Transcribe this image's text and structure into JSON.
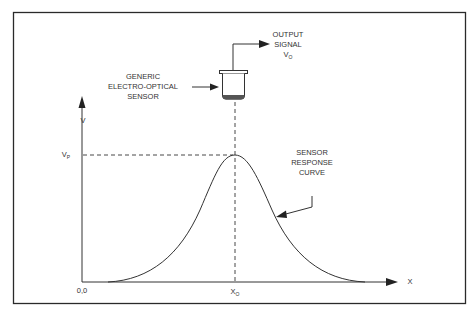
{
  "diagram": {
    "labels": {
      "output_signal": [
        "OUTPUT",
        "SIGNAL"
      ],
      "output_symbol": "V",
      "output_subscript": "O",
      "sensor": [
        "GENERIC",
        "ELECTRO-OPTICAL",
        "SENSOR"
      ],
      "y_axis": "V",
      "peak_symbol": "V",
      "peak_subscript": "P",
      "curve": [
        "SENSOR",
        "RESPONSE",
        "CURVE"
      ],
      "origin": "0,0",
      "x0_symbol": "X",
      "x0_subscript": "O",
      "x_axis": "X"
    },
    "colors": {
      "line": "#333333",
      "frame": "#2a2a2a",
      "background": "#ffffff"
    }
  }
}
